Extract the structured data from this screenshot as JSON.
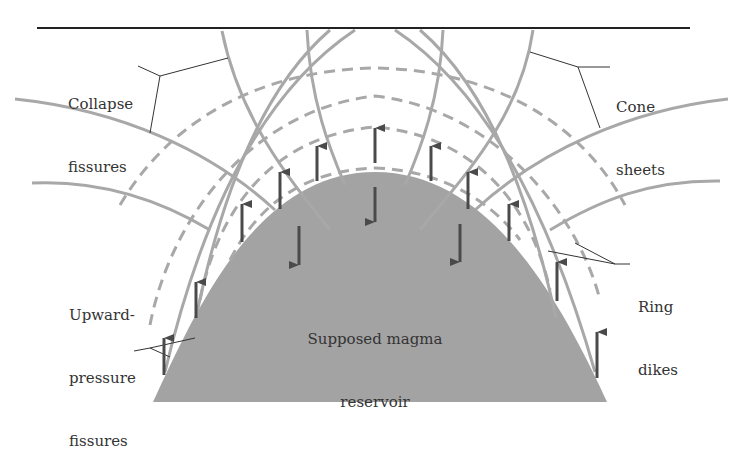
{
  "labels": {
    "collapse_fissures": {
      "line1": "Collapse",
      "line2": "fissures"
    },
    "cone_sheets": {
      "line1": "Cone",
      "line2": "sheets"
    },
    "upward_pressure_fissures": {
      "line1": "Upward-",
      "line2": "pressure",
      "line3": "fissures"
    },
    "ring_dikes": {
      "line1": "Ring",
      "line2": "dikes"
    },
    "magma_reservoir": {
      "line1": "Supposed magma",
      "line2": "reservoir"
    }
  },
  "colors": {
    "reservoir_fill": "#a3a3a3",
    "fissure_line": "#a8a8a8",
    "arrow": "#4a4a4a",
    "ground_surface": "#222222",
    "leader_line": "#333333"
  }
}
